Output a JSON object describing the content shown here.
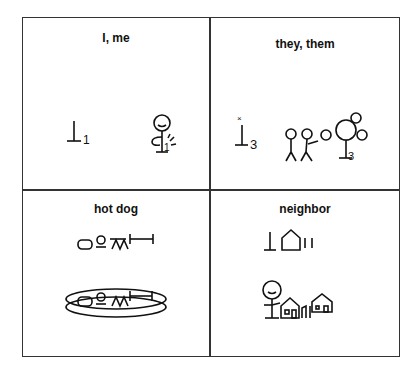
{
  "cells": [
    {
      "label": "I, me",
      "symbol": "I-me-blissymbol",
      "indicator_number": "1"
    },
    {
      "label": "they, them",
      "symbol": "they-them-blissymbol",
      "indicator_number": "3"
    },
    {
      "label": "hot dog",
      "symbol": "hot-dog-blissymbol"
    },
    {
      "label": "neighbor",
      "symbol": "neighbor-blissymbol"
    }
  ]
}
